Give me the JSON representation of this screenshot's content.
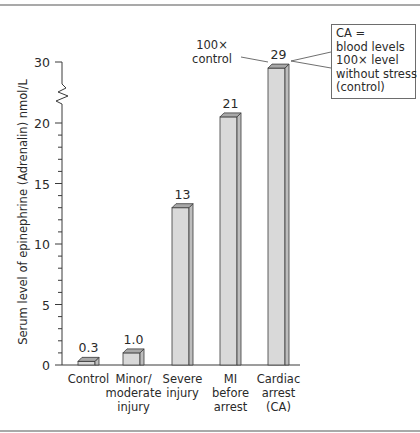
{
  "chart_data": {
    "type": "bar",
    "title": "",
    "xlabel": "",
    "ylabel": "Serum level of epinephrine (Adrenalin) nmol/L",
    "categories": [
      "Control",
      "Minor/ moderate injury",
      "Severe injury",
      "MI before arrest",
      "Cardiac arrest (CA)"
    ],
    "category_lines": [
      [
        "Control"
      ],
      [
        "Minor/",
        "moderate",
        "injury"
      ],
      [
        "Severe",
        "injury"
      ],
      [
        "MI",
        "before",
        "arrest"
      ],
      [
        "Cardiac",
        "arrest",
        "(CA)"
      ]
    ],
    "values": [
      0.3,
      1.0,
      13,
      21,
      29
    ],
    "value_labels": [
      "0.3",
      "1.0",
      "13",
      "21",
      "29"
    ],
    "yticks": [
      "0",
      "5",
      "10",
      "15",
      "20",
      "30"
    ],
    "ylim": [
      0,
      30
    ],
    "axis_break": "between 20 and 30",
    "grid": false,
    "legend": null,
    "bar_style": "3D prism, light gray",
    "colors": {
      "bar_face": "#d9d9d9",
      "bar_side": "#bdbdbd",
      "bar_top": "#a8a8a8",
      "stroke": "#3a3a3a"
    },
    "annotations": [
      {
        "text": [
          "100×",
          "control"
        ],
        "points_to": "Cardiac arrest (CA)"
      },
      {
        "text": [
          "CA =",
          "blood levels",
          "100× level",
          "without stress",
          "(control)"
        ],
        "type": "callout box",
        "points_to": "Cardiac arrest (CA)"
      }
    ]
  },
  "callout": {
    "lines": [
      "CA =",
      "blood levels",
      "100× level",
      "without stress",
      "(control)"
    ]
  },
  "annotation_left": {
    "line1": "100×",
    "line2": "control"
  }
}
